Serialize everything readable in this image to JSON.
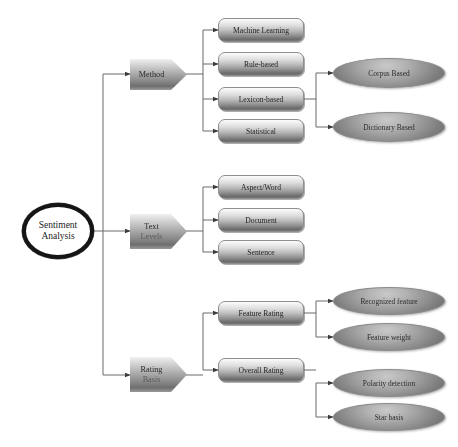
{
  "diagram": {
    "root": {
      "name": "sentiment-analysis-root",
      "line1": "Sentiment",
      "line2": "Analysis"
    },
    "branches": [
      {
        "name": "method",
        "line1": "Method",
        "line2": "",
        "children": [
          {
            "name": "machine-learning",
            "label": "Machine Learning",
            "leaves": []
          },
          {
            "name": "rule-based",
            "label": "Rule-based",
            "leaves": []
          },
          {
            "name": "lexicon-based",
            "label": "Lexicon-based",
            "leaves": [
              {
                "name": "corpus-based",
                "label": "Corpus Based"
              },
              {
                "name": "dictionary-based",
                "label": "Dictionary Based"
              }
            ]
          },
          {
            "name": "statistical",
            "label": "Statistical",
            "leaves": []
          }
        ]
      },
      {
        "name": "text-levels",
        "line1": "Text",
        "line2": "Levels",
        "children": [
          {
            "name": "aspect-word",
            "label": "Aspect/Word",
            "leaves": []
          },
          {
            "name": "document",
            "label": "Document",
            "leaves": []
          },
          {
            "name": "sentence",
            "label": "Sentence",
            "leaves": []
          }
        ]
      },
      {
        "name": "rating-basis",
        "line1": "Rating",
        "line2": "Basis",
        "children": [
          {
            "name": "feature-rating",
            "label": "Feature Rating",
            "leaves": [
              {
                "name": "recognized-feature",
                "label": "Recognized feature"
              },
              {
                "name": "feature-weight",
                "label": "Feature weight"
              }
            ]
          },
          {
            "name": "overall-rating",
            "label": "Overall Rating",
            "leaves": [
              {
                "name": "polarity-detection",
                "label": "Polarity detection"
              },
              {
                "name": "star-basis",
                "label": "Star basis"
              }
            ]
          }
        ]
      }
    ],
    "colors": {
      "line": "#6f6f6f",
      "root_ring": "#151515",
      "node_fill_light": "#f0f0f0",
      "node_fill_dark": "#6e6e6e",
      "text": "#1b1b1b",
      "background": "#ffffff"
    }
  }
}
